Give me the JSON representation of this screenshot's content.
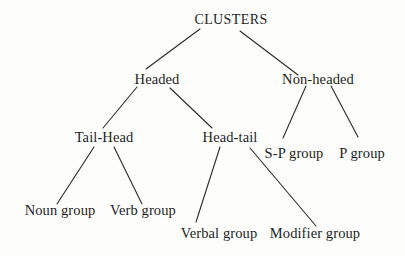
{
  "diagram": {
    "type": "tree",
    "root": "CLUSTERS",
    "nodes": [
      {
        "id": "clusters",
        "label": "CLUSTERS",
        "x": 231,
        "y": 12
      },
      {
        "id": "headed",
        "label": "Headed",
        "x": 157,
        "y": 71
      },
      {
        "id": "non_headed",
        "label": "Non-headed",
        "x": 318,
        "y": 71
      },
      {
        "id": "tail_head",
        "label": "Tail-Head",
        "x": 104,
        "y": 129
      },
      {
        "id": "head_tail",
        "label": "Head-tail",
        "x": 230,
        "y": 129
      },
      {
        "id": "sp_group",
        "label": "S-P group",
        "x": 294,
        "y": 145
      },
      {
        "id": "p_group",
        "label": "P group",
        "x": 362,
        "y": 145
      },
      {
        "id": "noun_group",
        "label": "Noun group",
        "x": 60,
        "y": 202
      },
      {
        "id": "verb_group",
        "label": "Verb group",
        "x": 143,
        "y": 202
      },
      {
        "id": "verbal_group",
        "label": "Verbal group",
        "x": 219,
        "y": 225
      },
      {
        "id": "modifier_group",
        "label": "Modifier group",
        "x": 315,
        "y": 225
      }
    ],
    "edges": [
      {
        "from": "clusters",
        "to": "headed",
        "x1": 200,
        "y1": 29,
        "x2": 146,
        "y2": 69
      },
      {
        "from": "clusters",
        "to": "non_headed",
        "x1": 240,
        "y1": 31,
        "x2": 298,
        "y2": 75
      },
      {
        "from": "headed",
        "to": "tail_head",
        "x1": 137,
        "y1": 87,
        "x2": 103,
        "y2": 128
      },
      {
        "from": "headed",
        "to": "head_tail",
        "x1": 170,
        "y1": 88,
        "x2": 212,
        "y2": 128
      },
      {
        "from": "non_headed",
        "to": "sp_group",
        "x1": 306,
        "y1": 86,
        "x2": 283,
        "y2": 138
      },
      {
        "from": "non_headed",
        "to": "p_group",
        "x1": 331,
        "y1": 86,
        "x2": 358,
        "y2": 137
      },
      {
        "from": "tail_head",
        "to": "noun_group",
        "x1": 94,
        "y1": 147,
        "x2": 57,
        "y2": 204
      },
      {
        "from": "tail_head",
        "to": "verb_group",
        "x1": 114,
        "y1": 147,
        "x2": 142,
        "y2": 204
      },
      {
        "from": "head_tail",
        "to": "verbal_group",
        "x1": 220,
        "y1": 147,
        "x2": 196,
        "y2": 222
      },
      {
        "from": "head_tail",
        "to": "modifier_group",
        "x1": 250,
        "y1": 148,
        "x2": 316,
        "y2": 226
      }
    ]
  },
  "labels": {
    "clusters": "CLUSTERS",
    "headed": "Headed",
    "non_headed": "Non-headed",
    "tail_head": "Tail-Head",
    "head_tail": "Head-tail",
    "sp_group": "S-P group",
    "p_group": "P group",
    "noun_group": "Noun group",
    "verb_group": "Verb group",
    "verbal_group": "Verbal group",
    "modifier_group": "Modifier group"
  },
  "colors": {
    "background": "#fdfdfb",
    "ink": "#1e1e1e",
    "line": "#2a2a2a"
  }
}
